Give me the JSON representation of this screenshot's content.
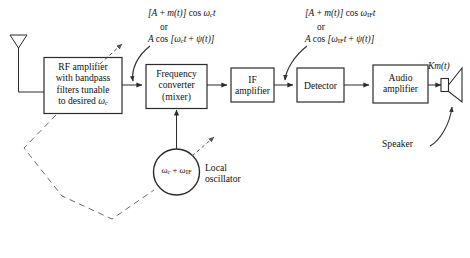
{
  "diagram": {
    "stroke_color": "#2b2b2b",
    "dashed_color": "#6b6b6b",
    "background": "#ffffff"
  },
  "blocks": {
    "rf_amplifier": {
      "line1": "RF amplifier",
      "line2": "with bandpass",
      "line3": "filters tunable",
      "line4_prefix": "to desired ",
      "line4_symbol": "ω",
      "line4_sub": "c"
    },
    "mixer": {
      "line1": "Frequency",
      "line2": "converter",
      "line3": "(mixer)"
    },
    "if_amplifier": {
      "line1": "IF",
      "line2": "amplifier"
    },
    "detector": {
      "line1": "Detector"
    },
    "audio_amplifier": {
      "line1": "Audio",
      "line2": "amplifier"
    }
  },
  "oscillator": {
    "symbol_w1": "ω",
    "sub1": "c",
    "plus": " + ",
    "symbol_w2": "ω",
    "sub2": "IF",
    "label_line1": "Local",
    "label_line2": "oscillator"
  },
  "formulas": {
    "rf_signal": {
      "line1_a": "[A",
      "line1_plus": " + ",
      "line1_b": "m(t)] ",
      "line1_cos": "cos ",
      "line1_omega": "ω",
      "line1_sub": "c",
      "line1_t": "t",
      "or": "or",
      "line2_a": "A ",
      "line2_cos": "cos ",
      "line2_b": "[ω",
      "line2_sub": "c",
      "line2_c": "t",
      "line2_plus": " + ",
      "line2_psi": "ψ(t)]"
    },
    "if_signal": {
      "line1_a": "[A",
      "line1_plus": " + ",
      "line1_b": "m(t)] ",
      "line1_cos": "cos ",
      "line1_omega": "ω",
      "line1_sub": "IF",
      "line1_t": "t",
      "or": "or",
      "line2_a": "A ",
      "line2_cos": "cos ",
      "line2_b": "[ω",
      "line2_sub": "IF",
      "line2_c": "t",
      "line2_plus": " + ",
      "line2_psi": "ψ(t)]"
    },
    "audio_output": {
      "text_k": "K",
      "text_m": "m(t)"
    }
  },
  "labels": {
    "speaker": "Speaker"
  }
}
